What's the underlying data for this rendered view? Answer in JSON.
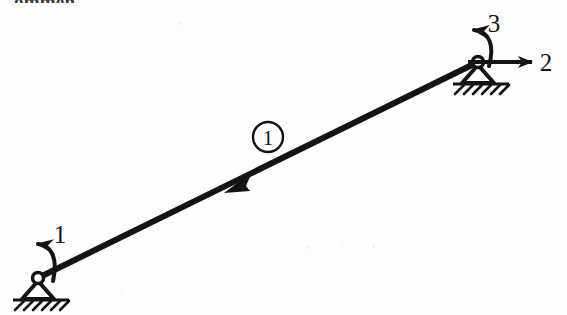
{
  "figure": {
    "type": "structural-beam-diagram",
    "background_color": "#fdfdfd",
    "ink_color": "#141414",
    "partial_heading_text": "ommen"
  },
  "nodes": [
    {
      "id": "left-support",
      "name": "left-pin-support",
      "x": 38,
      "y": 278,
      "support_type": "pin",
      "hatch_count": 6
    },
    {
      "id": "right-support",
      "name": "right-pin-support",
      "x": 478,
      "y": 62,
      "support_type": "pin",
      "hatch_count": 6
    }
  ],
  "element": {
    "label": "1",
    "label_x": 268,
    "label_y": 137,
    "label_radius": 15,
    "start_x": 38,
    "start_y": 278,
    "end_x": 478,
    "end_y": 62,
    "direction_arrow_x": 237,
    "direction_arrow_y": 182,
    "direction": "up-right"
  },
  "dofs": [
    {
      "id": "dof-1",
      "label": "1",
      "kind": "moment",
      "sense": "counterclockwise",
      "at_node": "left-support",
      "label_x": 60,
      "label_y": 243
    },
    {
      "id": "dof-2",
      "label": "2",
      "kind": "force",
      "sense": "right",
      "at_node": "right-support",
      "label_x": 546,
      "label_y": 62
    },
    {
      "id": "dof-3",
      "label": "3",
      "kind": "moment",
      "sense": "counterclockwise",
      "at_node": "right-support",
      "label_x": 494,
      "label_y": 32
    }
  ]
}
